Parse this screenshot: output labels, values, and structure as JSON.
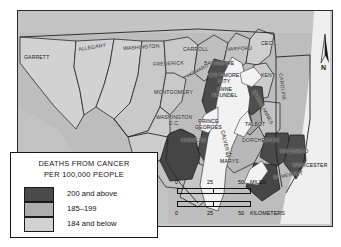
{
  "figure": {
    "kind": "choropleth-map"
  },
  "legend": {
    "title_line1": "DEATHS FROM CANCER",
    "title_line2": "PER 100,000 PEOPLE",
    "classes": [
      {
        "label": "200 and above",
        "color": "#4a4a4a"
      },
      {
        "label": "185–199",
        "color": "#adadad"
      },
      {
        "label": "184 and below",
        "color": "#d2d2d2"
      }
    ]
  },
  "scale": {
    "miles": {
      "zero": "0",
      "mid": "25",
      "max": "50",
      "unit": "MILES"
    },
    "kilometers": {
      "zero": "0",
      "mid": "25",
      "max": "50",
      "unit": "KILOMETERS"
    }
  },
  "compass": {
    "label": "N"
  },
  "map": {
    "background_color": "#c9c9c9",
    "water_color": "#f2f2f2",
    "outside_color": "#bcbcbc",
    "border_color": "#262626",
    "labels": [
      {
        "name": "GARRETT",
        "line2": "",
        "x": 6,
        "y": 44,
        "rot": 0
      },
      {
        "name": "ALLEGANY",
        "line2": "",
        "x": 60,
        "y": 36,
        "rot": -9
      },
      {
        "name": "WASHINGTON",
        "line2": "",
        "x": 105,
        "y": 35,
        "rot": -4
      },
      {
        "name": "FREDERICK",
        "line2": "",
        "x": 135,
        "y": 51,
        "rot": -3
      },
      {
        "name": "CARROLL",
        "line2": "",
        "x": 165,
        "y": 36,
        "rot": 0
      },
      {
        "name": "HARFORD",
        "line2": "",
        "x": 208,
        "y": 36,
        "rot": -3
      },
      {
        "name": "CECIL",
        "line2": "",
        "x": 243,
        "y": 30,
        "rot": 0
      },
      {
        "name": "BALTIMORE",
        "line2": "",
        "x": 186,
        "y": 50,
        "rot": 0
      },
      {
        "name": "BALTIMORE",
        "line2": "CITY",
        "x": 191,
        "y": 62,
        "rot": 0
      },
      {
        "name": "KENT",
        "line2": "",
        "x": 243,
        "y": 62,
        "rot": 0
      },
      {
        "name": "HOWARD",
        "line2": "",
        "x": 168,
        "y": 63,
        "rot": -28
      },
      {
        "name": "MONTGOMERY",
        "line2": "",
        "x": 136,
        "y": 79,
        "rot": 0
      },
      {
        "name": "ANNE",
        "line2": "ARUNDEL",
        "x": 194,
        "y": 76,
        "rot": 0
      },
      {
        "name": "QUEEN ANNES",
        "line2": "",
        "x": 238,
        "y": 78,
        "rot": 62
      },
      {
        "name": "CAROLINE",
        "line2": "",
        "x": 265,
        "y": 62,
        "rot": 82
      },
      {
        "name": "WASHINGTON",
        "line2": "D.C.",
        "x": 138,
        "y": 104,
        "rot": 0
      },
      {
        "name": "PRINCE",
        "line2": "GEORGES",
        "x": 177,
        "y": 108,
        "rot": 0
      },
      {
        "name": "TALBOT",
        "line2": "",
        "x": 227,
        "y": 111,
        "rot": 0
      },
      {
        "name": "CHARLES",
        "line2": "",
        "x": 163,
        "y": 127,
        "rot": 0
      },
      {
        "name": "CALVERT",
        "line2": "",
        "x": 207,
        "y": 119,
        "rot": 78
      },
      {
        "name": "DORCHESTER",
        "line2": "",
        "x": 224,
        "y": 127,
        "rot": 0
      },
      {
        "name": "ST.",
        "line2": "MARYS",
        "x": 202,
        "y": 142,
        "rot": 0
      },
      {
        "name": "WICOMICO",
        "line2": "",
        "x": 262,
        "y": 138,
        "rot": 0
      },
      {
        "name": "WORCESTER",
        "line2": "",
        "x": 275,
        "y": 152,
        "rot": 0
      },
      {
        "name": "SOMERSET",
        "line2": "",
        "x": 255,
        "y": 164,
        "rot": -8
      }
    ]
  }
}
